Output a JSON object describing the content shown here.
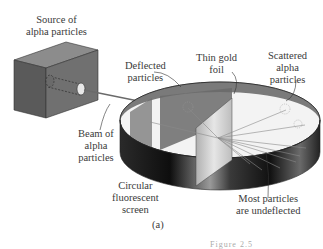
{
  "diagram": {
    "labels": {
      "source": [
        "Source of",
        "alpha particles"
      ],
      "deflected": [
        "Deflected",
        "particles"
      ],
      "foil": [
        "Thin gold",
        "foil"
      ],
      "scattered": [
        "Scattered",
        "alpha",
        "particles"
      ],
      "beam": [
        "Beam of",
        "alpha",
        "particles"
      ],
      "screen": [
        "Circular",
        "fluorescent",
        "screen"
      ],
      "undeflected": [
        "Most particles",
        "are undeflected"
      ]
    },
    "panel_label": "(a)",
    "figure_caption_partial": "Figure 2.5"
  },
  "colors": {
    "box_front": "#5e5e5e",
    "box_top": "#8a8a8a",
    "box_side": "#6e6e6e",
    "ring_inner": "#7a7a7a",
    "ring_outer_dark": "#1a1a1a",
    "foil": "#c8c8c8",
    "beam": "#777777"
  }
}
